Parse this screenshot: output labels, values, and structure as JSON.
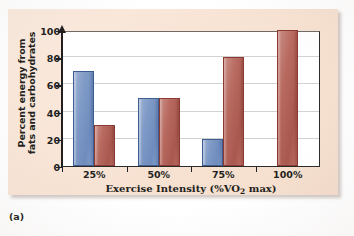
{
  "figure": {
    "caption": "(a)",
    "panel_background": "#f9e6d8"
  },
  "chart_data": {
    "type": "bar",
    "title": "",
    "xlabel_parts": {
      "pre": "Exercise Intensity (%VO",
      "sub": "2",
      "post": " max)"
    },
    "xlabel": "Exercise Intensity (%VO2 max)",
    "ylabel_line1": "Percent energy from",
    "ylabel_line2": "fats and carbohydrates",
    "ylabel": "Percent energy from fats and carbohydrates",
    "categories": [
      "25%",
      "50%",
      "75%",
      "100%"
    ],
    "yticks": [
      0,
      20,
      40,
      60,
      80,
      100
    ],
    "ylim": [
      0,
      100
    ],
    "grid": true,
    "legend": "none",
    "series": [
      {
        "name": "Fats",
        "color": "#7f9ac6",
        "values": [
          70,
          50,
          20,
          0
        ]
      },
      {
        "name": "Carbohydrates",
        "color": "#b86a60",
        "values": [
          30,
          50,
          80,
          100
        ]
      }
    ]
  }
}
